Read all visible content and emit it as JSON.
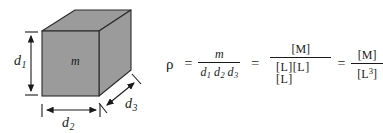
{
  "figure": {
    "kind": "density-definition-diagram",
    "background_color": "#ffffff",
    "ink_color": "#1a1a1a"
  },
  "solid": {
    "name": "rectangular-box",
    "mass_label": "m",
    "face_fill": "#9b9b9b",
    "top_fill": "#9b9b9b",
    "side_fill": "#9b9b9b",
    "edge_color": "#2b2b2b"
  },
  "dimensions": [
    {
      "id": "d1",
      "label": "d",
      "subscript": "1",
      "orientation": "vertical",
      "position": "left"
    },
    {
      "id": "d2",
      "label": "d",
      "subscript": "2",
      "orientation": "horizontal",
      "position": "bottom"
    },
    {
      "id": "d3",
      "label": "d",
      "subscript": "3",
      "orientation": "diagonal",
      "position": "bottom-right"
    }
  ],
  "equation": {
    "symbol": "ρ",
    "equals": "=",
    "terms": [
      {
        "id": "term-volume",
        "numerator": "m",
        "denominator_parts": [
          {
            "base": "d",
            "sub": "1"
          },
          {
            "base": "d",
            "sub": "2"
          },
          {
            "base": "d",
            "sub": "3"
          }
        ]
      },
      {
        "id": "term-dimensions-expanded",
        "numerator": "[M]",
        "denominator": "[L][L][L]"
      },
      {
        "id": "term-dimensions-compact",
        "numerator": "[M]",
        "denominator_base": "[L",
        "denominator_exponent": "3",
        "denominator_close": "]"
      }
    ]
  }
}
